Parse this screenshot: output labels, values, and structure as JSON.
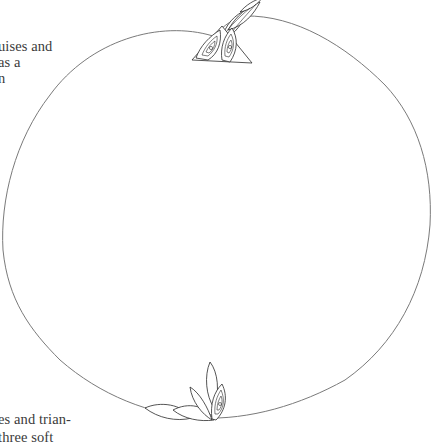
{
  "document": {
    "type": "illustrated book page (cropped)",
    "top_text_lines": [
      "uises and",
      "as a",
      "n"
    ],
    "bottom_text_lines": [
      "es and trian-",
      "three soft"
    ]
  },
  "illustration": {
    "subject": "line drawing of a round fruit outline with stylized leaf ornaments at the stem and blossom ends",
    "outline_color": "#7a7a7a",
    "ink_color": "#2a2a2a",
    "elements": [
      {
        "name": "fruit-outline",
        "description": "large rounded fruit contour"
      },
      {
        "name": "stem-ornament",
        "description": "triangular motif with spiral swirls and twisting leaves at the top"
      },
      {
        "name": "blossom-ornament",
        "description": "fan of almond-shaped leaves with a spiral leaf at the bottom"
      }
    ]
  }
}
